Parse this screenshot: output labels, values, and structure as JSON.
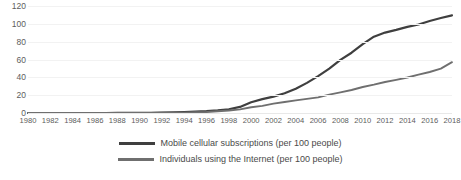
{
  "chart_data": {
    "type": "line",
    "title": "",
    "subtitle": "",
    "xlabel": "",
    "ylabel": "",
    "xlim": [
      1980,
      2018
    ],
    "ylim": [
      0,
      120
    ],
    "grid": true,
    "legend_position": "bottom",
    "y_ticks": [
      "120",
      "100",
      "80",
      "60",
      "40",
      "20",
      "0"
    ],
    "y_tick_values": [
      120,
      100,
      80,
      60,
      40,
      20,
      0
    ],
    "x_ticks": [
      "1980",
      "1982",
      "1984",
      "1986",
      "1988",
      "1990",
      "1992",
      "1994",
      "1996",
      "1998",
      "2000",
      "2002",
      "2004",
      "2006",
      "2008",
      "2010",
      "2012",
      "2014",
      "2016",
      "2018"
    ],
    "x": [
      1980,
      1981,
      1982,
      1983,
      1984,
      1985,
      1986,
      1987,
      1988,
      1989,
      1990,
      1991,
      1992,
      1993,
      1994,
      1995,
      1996,
      1997,
      1998,
      1999,
      2000,
      2001,
      2002,
      2003,
      2004,
      2005,
      2006,
      2007,
      2008,
      2009,
      2010,
      2011,
      2012,
      2013,
      2014,
      2015,
      2016,
      2017,
      2018
    ],
    "series": [
      {
        "name": "Mobile cellular subscriptions (per 100 people)",
        "color": "#3f3f3f",
        "width": 2.2,
        "values": [
          0,
          0,
          0,
          0,
          0,
          0,
          0.01,
          0.02,
          0.03,
          0.05,
          0.2,
          0.3,
          0.5,
          0.7,
          1,
          1.5,
          2.1,
          3,
          4.2,
          6.8,
          12.1,
          15.5,
          18.4,
          22.1,
          27.3,
          33.8,
          41.3,
          49.8,
          59.5,
          67.6,
          77.2,
          85.6,
          90.2,
          93.2,
          96.6,
          99.3,
          103.2,
          106.5,
          109.5
        ]
      },
      {
        "name": "Individuals using the Internet (per 100 people)",
        "color": "#6f6f6f",
        "width": 1.9,
        "values": [
          0,
          0,
          0,
          0,
          0,
          0,
          0,
          0,
          0,
          0,
          0.05,
          0.1,
          0.2,
          0.3,
          0.45,
          0.8,
          1.2,
          1.9,
          2.8,
          4.1,
          6.5,
          8.0,
          10.5,
          12.3,
          14.1,
          15.8,
          17.5,
          20.6,
          23.1,
          25.8,
          29.2,
          31.8,
          34.8,
          37.2,
          39.8,
          43.0,
          46.0,
          49.7,
          57.0
        ]
      }
    ]
  },
  "legend": {
    "items": [
      {
        "label": "Mobile cellular subscriptions (per 100 people)",
        "color": "#3f3f3f"
      },
      {
        "label": "Individuals using the Internet (per 100 people)",
        "color": "#6f6f6f"
      }
    ]
  }
}
